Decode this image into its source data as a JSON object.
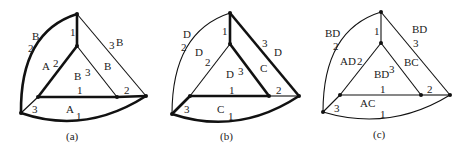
{
  "figure": {
    "panels": [
      {
        "id": "a",
        "caption": "(a)",
        "labels": {
          "left_arc_letter": "B",
          "left_arc_num": "2",
          "top_inner_num": "1",
          "top_right_num": "3",
          "top_right_letter": "B",
          "apex_left_letter": "A",
          "apex_left_num": "2",
          "center_letter": "B",
          "center_num": "3",
          "apex_right_letter": "B",
          "inner_bottom_num": "1",
          "right_stub_num": "2",
          "left_stub_num": "3",
          "bottom_arc_letter": "A",
          "bottom_arc_num": "1"
        },
        "thick_edges": [
          "left_arc",
          "top_apex",
          "apex_innerleft",
          "innerleft_innerright",
          "innerright_outerright",
          "bottom_arc"
        ]
      },
      {
        "id": "b",
        "caption": "(b)",
        "labels": {
          "left_arc_letter": "D",
          "left_arc_num": "2",
          "top_inner_num": "1",
          "top_right_num": "3",
          "top_right_letter": "D",
          "apex_left_letter": "D",
          "apex_left_num": "2",
          "center_letter": "D",
          "center_num": "3",
          "apex_right_letter": "C",
          "inner_bottom_num": "1",
          "right_stub_num": "2",
          "left_stub_num": "3",
          "bottom_arc_letter": "C",
          "bottom_arc_num": "1"
        },
        "thick_edges": [
          "top_apex",
          "top_outerright",
          "apex_innerright",
          "innerleft_innerright",
          "outerleft_innerleft",
          "bottom_arc"
        ]
      },
      {
        "id": "c",
        "caption": "(c)",
        "labels": {
          "left_arc_letter": "BD",
          "left_arc_num": "2",
          "top_inner_num": "1",
          "top_right_num": "3",
          "top_right_letter": "BD",
          "apex_left_letter": "AD",
          "apex_left_num": "2",
          "center_letter": "BD",
          "center_num": "3",
          "apex_right_letter": "BC",
          "inner_bottom_num": "1",
          "right_stub_num": "2",
          "left_stub_num": "3",
          "bottom_arc_letter": "AC",
          "bottom_arc_num": "1"
        },
        "thick_edges": []
      }
    ]
  }
}
